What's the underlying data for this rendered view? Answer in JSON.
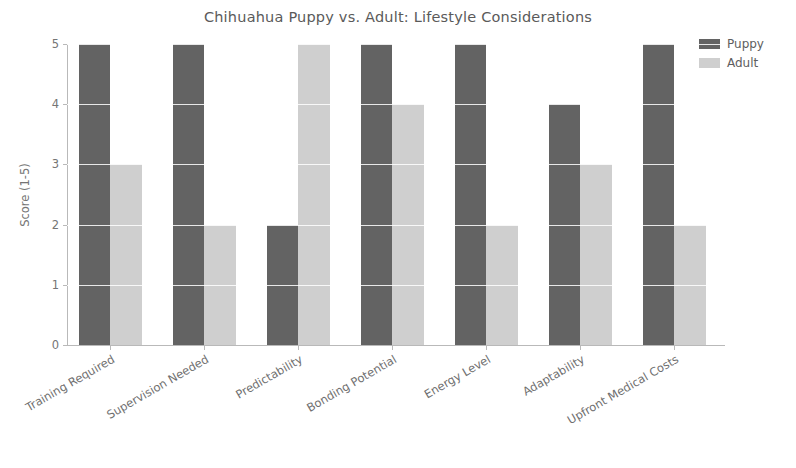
{
  "chart_data": {
    "type": "bar",
    "title": "Chihuahua Puppy vs. Adult: Lifestyle Considerations",
    "xlabel": "",
    "ylabel": "Score (1-5)",
    "ylim": [
      0,
      5
    ],
    "yticks": [
      0,
      1,
      2,
      3,
      4,
      5
    ],
    "ytick_labels": [
      "0",
      "1",
      "2",
      "3",
      "4",
      "5"
    ],
    "grid": true,
    "legend_position": "upper right",
    "categories": [
      "Training Required",
      "Supervision Needed",
      "Predictability",
      "Bonding Potential",
      "Energy Level",
      "Adaptability",
      "Upfront Medical Costs"
    ],
    "series": [
      {
        "name": "Puppy",
        "color": "#636363",
        "values": [
          5,
          5,
          2,
          5,
          5,
          4,
          5
        ]
      },
      {
        "name": "Adult",
        "color": "#cfcfcf",
        "values": [
          3,
          2,
          5,
          4,
          2,
          3,
          2
        ]
      }
    ]
  },
  "legend": {
    "items": [
      {
        "label": "Puppy"
      },
      {
        "label": "Adult"
      }
    ]
  }
}
